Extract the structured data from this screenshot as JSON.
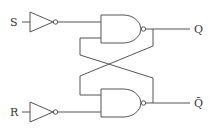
{
  "diagram": {
    "labels": {
      "s_input": "S",
      "r_input": "R",
      "q_output": "Q",
      "qbar_output": "Q̄"
    },
    "components": [
      {
        "type": "inverter",
        "input": "S"
      },
      {
        "type": "inverter",
        "input": "R"
      },
      {
        "type": "nand",
        "output": "Q"
      },
      {
        "type": "nand",
        "output": "Q̄"
      }
    ],
    "colors": {
      "stroke": "#555555",
      "text": "#333333",
      "background": "#ffffff"
    }
  }
}
